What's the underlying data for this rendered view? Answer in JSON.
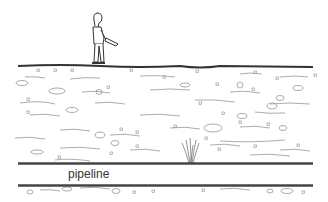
{
  "diagram": {
    "labels": {
      "pipeline": "pipeline"
    },
    "elements": [
      "person-with-detector",
      "ground-surface",
      "soil-layer",
      "leak-plume",
      "pipeline-top-wall",
      "pipeline-bottom-wall"
    ],
    "colors": {
      "line": "#333333",
      "soil_marks": "#777777",
      "background": "#ffffff"
    }
  }
}
